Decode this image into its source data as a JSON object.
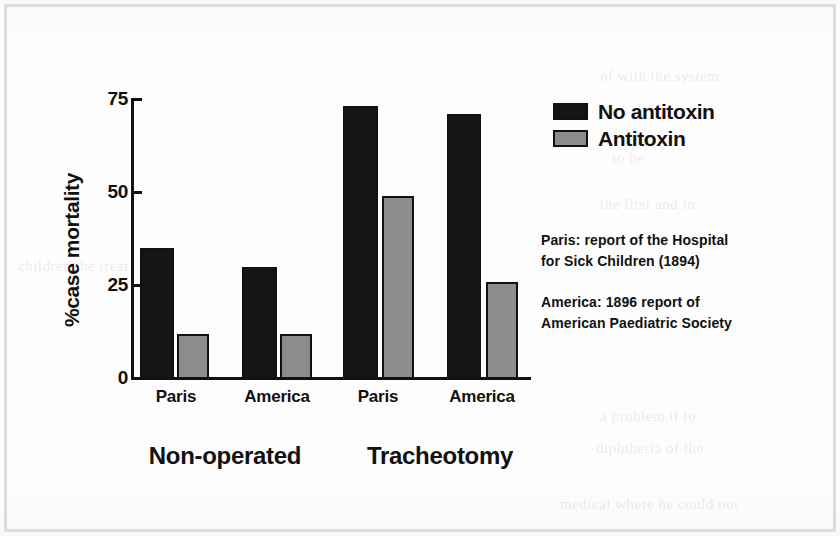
{
  "chart_data": {
    "type": "bar",
    "title": "",
    "xlabel": "",
    "ylabel": "%case mortality",
    "ylim": [
      0,
      75
    ],
    "yticks": [
      "0",
      "25",
      "50",
      "75"
    ],
    "grid": false,
    "legend_position": "top-right",
    "groups": [
      {
        "label": "Non-operated",
        "categories": [
          "Paris",
          "America"
        ]
      },
      {
        "label": "Tracheotomy",
        "categories": [
          "Paris",
          "America"
        ]
      }
    ],
    "categories": [
      "Paris",
      "America",
      "Paris",
      "America"
    ],
    "series": [
      {
        "name": "No antitoxin",
        "color": "#151515",
        "values": [
          35,
          30,
          73,
          71
        ]
      },
      {
        "name": "Antitoxin",
        "color": "#8c8c8c",
        "values": [
          12,
          12,
          49,
          26
        ]
      }
    ],
    "annotations": [
      {
        "lines": [
          "Paris: report of the Hospital",
          "for Sick Children (1894)"
        ]
      },
      {
        "lines": [
          "America: 1896 report of",
          "American Paediatric Society"
        ]
      }
    ]
  },
  "legend": {
    "items": [
      {
        "label": "No antitoxin",
        "swatch": "black"
      },
      {
        "label": "Antitoxin",
        "swatch": "gray"
      }
    ]
  },
  "ghost_text": {
    "lines": [
      "of with the system",
      "to be",
      "the first and in",
      "children the treat",
      "a problem if to",
      "diphtheria of the",
      "medical where he could not"
    ]
  }
}
